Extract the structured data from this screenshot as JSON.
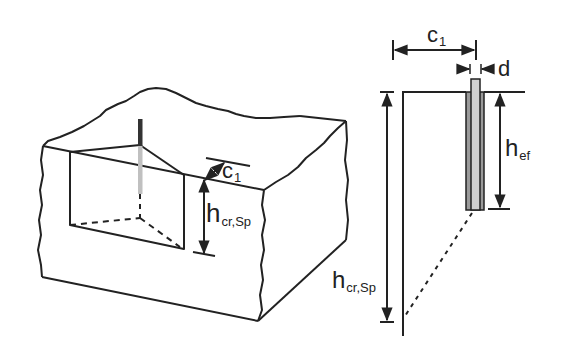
{
  "figure": {
    "colors": {
      "line": "#222222",
      "anchor_dark": "#333333",
      "anchor_light": "#c8c8c8",
      "background": "#ffffff"
    },
    "left_view": {
      "name": "3d-concrete-block",
      "labels": {
        "c1": {
          "main": "c",
          "sub": "1"
        },
        "h_cr_sp": {
          "main": "h",
          "sub": "cr,Sp"
        }
      }
    },
    "right_view": {
      "name": "cross-section",
      "labels": {
        "c1": {
          "main": "c",
          "sub": "1"
        },
        "d": {
          "main": "d"
        },
        "h_ef": {
          "main": "h",
          "sub": "ef"
        },
        "h_cr_sp": {
          "main": "h",
          "sub": "cr,Sp"
        }
      }
    }
  }
}
